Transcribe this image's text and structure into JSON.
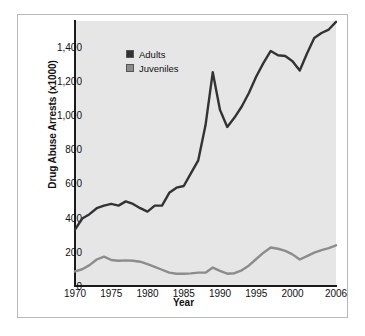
{
  "chart_data": {
    "type": "line",
    "title": "",
    "xlabel": "Year",
    "ylabel": "Drug Abuse Arrests (x1000)",
    "xlim": [
      1970,
      2006
    ],
    "ylim": [
      0,
      1550
    ],
    "xticks": [
      "1970",
      "1975",
      "1980",
      "1985",
      "1990",
      "1995",
      "2000",
      "2006"
    ],
    "xtick_values": [
      1970,
      1975,
      1980,
      1985,
      1990,
      1995,
      2000,
      2006
    ],
    "yticks": [
      "0",
      "200",
      "400",
      "600",
      "800",
      "1,000",
      "1,200",
      "1,400"
    ],
    "ytick_values": [
      0,
      200,
      400,
      600,
      800,
      1000,
      1200,
      1400
    ],
    "grid": false,
    "legend_position": "upper-left-inside",
    "plot_background": "#e6e6e6",
    "x": [
      1970,
      1971,
      1972,
      1973,
      1974,
      1975,
      1976,
      1977,
      1978,
      1979,
      1980,
      1981,
      1982,
      1983,
      1984,
      1985,
      1986,
      1987,
      1988,
      1989,
      1990,
      1991,
      1992,
      1993,
      1994,
      1995,
      1996,
      1997,
      1998,
      1999,
      2000,
      2001,
      2002,
      2003,
      2004,
      2005,
      2006
    ],
    "series": [
      {
        "name": "Adults",
        "color": "#333333",
        "values": [
          330,
          395,
          420,
          455,
          470,
          480,
          470,
          495,
          480,
          455,
          435,
          470,
          470,
          545,
          575,
          585,
          660,
          735,
          940,
          1250,
          1030,
          930,
          985,
          1050,
          1130,
          1225,
          1305,
          1375,
          1350,
          1345,
          1315,
          1260,
          1360,
          1450,
          1480,
          1500,
          1545
        ]
      },
      {
        "name": "Juveniles",
        "color": "#8c8c8c",
        "values": [
          85,
          98,
          122,
          155,
          172,
          152,
          148,
          150,
          148,
          142,
          128,
          112,
          95,
          78,
          72,
          72,
          74,
          78,
          78,
          108,
          88,
          72,
          75,
          92,
          120,
          158,
          195,
          225,
          218,
          205,
          185,
          155,
          175,
          195,
          210,
          222,
          238
        ]
      }
    ]
  }
}
